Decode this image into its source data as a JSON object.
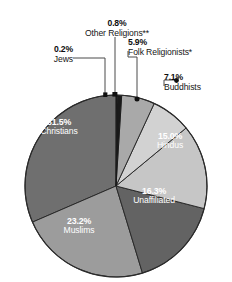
{
  "chart_data": {
    "type": "pie",
    "title": "",
    "xlabel": "",
    "ylabel": "",
    "legend_position": "labels-on-slices-and-callouts",
    "grid": false,
    "units": "percent",
    "categories": [
      "Christians",
      "Muslims",
      "Unaffiliated",
      "Hindus",
      "Buddhists",
      "Folk Religionists*",
      "Other Religions**",
      "Jews"
    ],
    "values": [
      31.5,
      23.2,
      16.3,
      15.0,
      7.1,
      5.9,
      0.8,
      0.2
    ],
    "value_labels": [
      "31.5%",
      "23.2%",
      "16.3%",
      "15.0%",
      "7.1%",
      "5.9%",
      "0.8%",
      "0.2%"
    ],
    "colors": [
      "#6f6f6f",
      "#9c9c9c",
      "#636363",
      "#c6c6c6",
      "#d2d2d2",
      "#a9a9a9",
      "#1a1a1a",
      "#1a1a1a"
    ],
    "slices": [
      {
        "name": "Christians",
        "value": 31.5,
        "label": "31.5%",
        "color": "#6f6f6f",
        "label_style": "inside-light"
      },
      {
        "name": "Muslims",
        "value": 23.2,
        "label": "23.2%",
        "color": "#9c9c9c",
        "label_style": "inside-light"
      },
      {
        "name": "Unaffiliated",
        "value": 16.3,
        "label": "16.3%",
        "color": "#636363",
        "label_style": "inside-light"
      },
      {
        "name": "Hindus",
        "value": 15.0,
        "label": "15.0%",
        "color": "#c6c6c6",
        "label_style": "inside-light"
      },
      {
        "name": "Buddhists",
        "value": 7.1,
        "label": "7.1%",
        "color": "#d2d2d2",
        "label_style": "callout"
      },
      {
        "name": "Folk Religionists*",
        "value": 5.9,
        "label": "5.9%",
        "color": "#a9a9a9",
        "label_style": "callout"
      },
      {
        "name": "Other Religions**",
        "value": 0.8,
        "label": "0.8%",
        "color": "#1a1a1a",
        "label_style": "callout"
      },
      {
        "name": "Jews",
        "value": 0.2,
        "label": "0.2%",
        "color": "#1a1a1a",
        "label_style": "callout"
      }
    ]
  },
  "callouts": {
    "other_religions": {
      "pct": "0.8%",
      "name": "Other Religions**"
    },
    "jews": {
      "pct": "0.2%",
      "name": "Jews"
    },
    "folk": {
      "pct": "5.9%",
      "name": "Folk Religionists*"
    },
    "buddhists": {
      "pct": "7.1%",
      "name": "Buddhists"
    }
  },
  "slice_labels": {
    "christians": {
      "pct": "31.5%",
      "name": "Christians"
    },
    "muslims": {
      "pct": "23.2%",
      "name": "Muslims"
    },
    "unaffiliated": {
      "pct": "16.3%",
      "name": "Unaffiliated"
    },
    "hindus": {
      "pct": "15.0%",
      "name": "Hindus"
    }
  }
}
